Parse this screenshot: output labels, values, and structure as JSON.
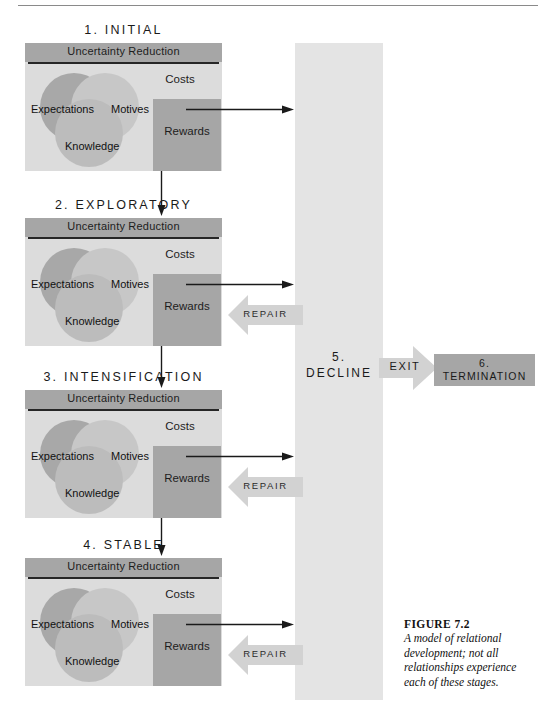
{
  "figure": {
    "caption_title": "FIGURE 7.2",
    "caption_text": "A model of relational development; not all relationships experience each of these stages."
  },
  "labels": {
    "uncertainty_reduction": "Uncertainty Reduction",
    "expectations": "Expectations",
    "motives": "Motives",
    "knowledge": "Knowledge",
    "costs": "Costs",
    "rewards": "Rewards",
    "repair": "REPAIR",
    "exit": "EXIT"
  },
  "stages": [
    {
      "id": "initial",
      "title": "1. INITIAL"
    },
    {
      "id": "exploratory",
      "title": "2. EXPLORATORY"
    },
    {
      "id": "intensification",
      "title": "3. INTENSIFICATION"
    },
    {
      "id": "stable",
      "title": "4. STABLE"
    }
  ],
  "decline": {
    "number": "5.",
    "name": "DECLINE"
  },
  "termination": {
    "number": "6.",
    "name": "TERMINATION"
  },
  "colors": {
    "stage_bg": "#dcdcdc",
    "band": "#a6a6a6",
    "decline_col": "#e4e4e4",
    "rewards": "#a6a6a6",
    "termination": "#a6a6a6",
    "arrow": "#d2d2d2",
    "venn_left": "#9a9a9a",
    "venn_right": "#c2c2c2",
    "venn_bottom": "#b4b4b4"
  }
}
